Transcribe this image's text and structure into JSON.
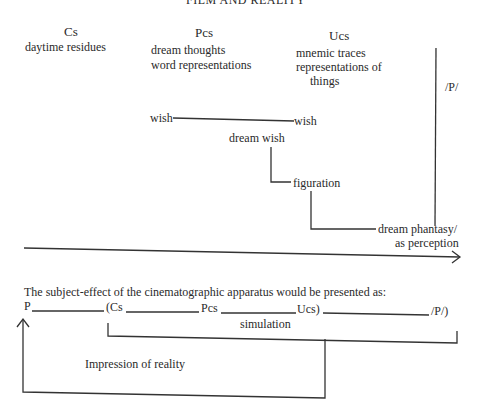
{
  "header": {
    "running_title": "FILM AND REALITY"
  },
  "top_diagram": {
    "columns": [
      {
        "title": "Cs",
        "lines": [
          "daytime residues"
        ]
      },
      {
        "title": "Pcs",
        "lines": [
          "dream thoughts",
          "word representations"
        ]
      },
      {
        "title": "Ucs",
        "lines": [
          "mnemic traces",
          "representations of",
          "things"
        ]
      }
    ],
    "perception_label": "/P/",
    "wish_left": "wish",
    "wish_right": "wish",
    "dream_wish": "dream wish",
    "figuration": "figuration",
    "dream_phantasy_line1": "dream phantasy/",
    "dream_phantasy_line2": "as perception"
  },
  "bottom_diagram": {
    "caption": "The subject-effect of the cinematographic apparatus would be presented as:",
    "sequence": {
      "p": "P",
      "cs": "(Cs",
      "pcs": "Pcs",
      "ucs": "Ucs)",
      "p_end": "/P/)"
    },
    "simulation": "simulation",
    "impression": "Impression of reality"
  }
}
